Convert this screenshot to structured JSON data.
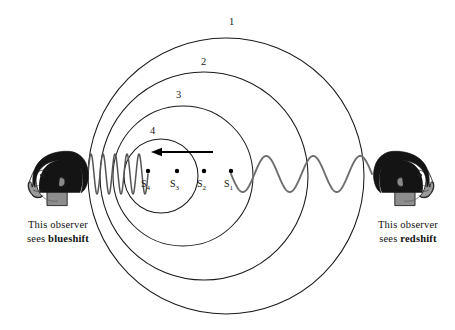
{
  "figure": {
    "background_color": "#ffffff",
    "width": 455,
    "height": 330
  },
  "wavefronts": {
    "label_name": "wavefront-number",
    "stroke_color": "#1a1a1a",
    "items": [
      {
        "label": "1",
        "cx": 226,
        "cy": 176,
        "r": 138,
        "label_x": 229,
        "label_y": 17
      },
      {
        "label": "2",
        "cx": 204,
        "cy": 176,
        "r": 104,
        "label_x": 201,
        "label_y": 57
      },
      {
        "label": "3",
        "cx": 183,
        "cy": 176,
        "r": 70,
        "label_x": 176,
        "label_y": 90
      },
      {
        "label": "4",
        "cx": 161,
        "cy": 176,
        "r": 37,
        "label_x": 150,
        "label_y": 126
      }
    ]
  },
  "sources": {
    "dot_color": "#000000",
    "items": [
      {
        "label": "S",
        "subscript": "4",
        "dot_x": 148,
        "dot_y": 171,
        "label_x": 141,
        "label_y": 179
      },
      {
        "label": "S",
        "subscript": "3",
        "dot_x": 177,
        "dot_y": 171,
        "label_x": 170,
        "label_y": 179
      },
      {
        "label": "S",
        "subscript": "2",
        "dot_x": 204,
        "dot_y": 171,
        "label_x": 197,
        "label_y": 179
      },
      {
        "label": "S",
        "subscript": "1",
        "dot_x": 231,
        "dot_y": 171,
        "label_x": 224,
        "label_y": 179
      }
    ]
  },
  "motion_arrow": {
    "name": "motion-direction-arrow",
    "direction": "left",
    "x_start": 213,
    "x_end": 151,
    "y": 152,
    "color": "#000000"
  },
  "waves": {
    "left": {
      "name": "compressed-wave-blueshift",
      "x_start": 88,
      "x_end": 148,
      "y_center": 174,
      "amplitude": 20,
      "wavelength": 12,
      "color": "#555555",
      "description": "short wavelength compressed wave"
    },
    "right": {
      "name": "stretched-wave-redshift",
      "x_start": 231,
      "x_end": 372,
      "y_center": 174,
      "amplitude": 18,
      "wavelength": 47,
      "color": "#6e6e6e",
      "description": "long wavelength stretched wave"
    }
  },
  "observers": {
    "left": {
      "name": "observer-left",
      "caption_line1": "This observer",
      "caption_line2_prefix": "sees ",
      "caption_line2_shift": "blueshift",
      "facing": "right",
      "head_x": 58,
      "head_y": 178
    },
    "right": {
      "name": "observer-right",
      "caption_line1": "This observer",
      "caption_line2_prefix": "sees ",
      "caption_line2_shift": "redshift",
      "facing": "left",
      "head_x": 404,
      "head_y": 178
    }
  },
  "colors": {
    "hair": "#141414",
    "skin": "#9a9a9a",
    "skin_shadow": "#6f6f6f",
    "outline": "#111111",
    "circle_stroke": "#1a1a1a"
  }
}
